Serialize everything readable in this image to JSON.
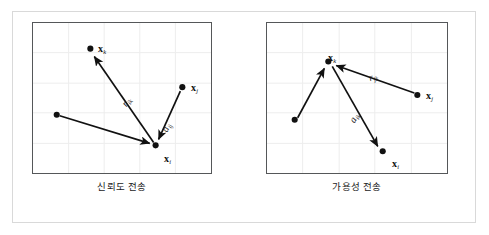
{
  "figure": {
    "type": "diagram",
    "background_color": "#ffffff",
    "frame_color": "#d9d9d9",
    "plot_border_color": "#555759",
    "grid_color": "#ececec",
    "ink_color": "#111111"
  },
  "panels": [
    {
      "id": "responsibility",
      "caption": "신뢰도 전송",
      "grid": {
        "columns": 4,
        "rows": 4,
        "visible": true
      },
      "nodes": [
        {
          "name": "node-xk",
          "label": "x",
          "sub": "k",
          "x": 58,
          "y": 26,
          "label_dx": 7,
          "label_dy": -12
        },
        {
          "name": "node-xj",
          "label": "x",
          "sub": "j",
          "x": 151,
          "y": 65,
          "label_dx": 7,
          "label_dy": -12
        },
        {
          "name": "node-xi",
          "label": "x",
          "sub": "i",
          "x": 124,
          "y": 124,
          "label_dx": 8,
          "label_dy": 2
        },
        {
          "name": "node-anon",
          "label": "",
          "sub": "",
          "x": 24,
          "y": 93,
          "label_dx": 0,
          "label_dy": 0
        }
      ],
      "arrows": [
        {
          "name": "arrow-xi-to-xk",
          "label": "r",
          "sub": "ik",
          "x1": 122,
          "y1": 121,
          "x2": 61,
          "y2": 32,
          "label_x": 97,
          "label_y": 74,
          "label_rot": -57
        },
        {
          "name": "arrow-xj-to-xi",
          "label": "a",
          "sub": "ij",
          "x1": 149,
          "y1": 69,
          "x2": 127,
          "y2": 120,
          "label_x": 140,
          "label_y": 100,
          "label_rot": -67
        },
        {
          "name": "arrow-anon-to-xi",
          "label": "",
          "sub": "",
          "x1": 27,
          "y1": 94,
          "x2": 120,
          "y2": 123,
          "label_x": 0,
          "label_y": 0,
          "label_rot": 0
        }
      ]
    },
    {
      "id": "availability",
      "caption": "가용성 전송",
      "grid": {
        "columns": 4,
        "rows": 4,
        "visible": true
      },
      "nodes": [
        {
          "name": "node-xk",
          "label": "x",
          "sub": "k",
          "x": 62,
          "y": 39,
          "label_dx": 4,
          "label_dy": -12
        },
        {
          "name": "node-xj",
          "label": "x",
          "sub": "j",
          "x": 152,
          "y": 73,
          "label_dx": 7,
          "label_dy": -10
        },
        {
          "name": "node-xi",
          "label": "x",
          "sub": "i",
          "x": 117,
          "y": 130,
          "label_dx": 8,
          "label_dy": 3
        },
        {
          "name": "node-anon",
          "label": "",
          "sub": "",
          "x": 28,
          "y": 98,
          "label_dx": 0,
          "label_dy": 0
        }
      ],
      "arrows": [
        {
          "name": "arrow-anon-to-xk",
          "label": "",
          "sub": "",
          "x1": 31,
          "y1": 96,
          "x2": 59,
          "y2": 44,
          "label_x": 0,
          "label_y": 0,
          "label_rot": 0
        },
        {
          "name": "arrow-xj-to-xk",
          "label": "r",
          "sub": "jk",
          "x1": 149,
          "y1": 71,
          "x2": 68,
          "y2": 42,
          "label_x": 105,
          "label_y": 50,
          "label_rot": -20
        },
        {
          "name": "arrow-xk-to-xi",
          "label": "a",
          "sub": "ik",
          "x1": 66,
          "y1": 44,
          "x2": 113,
          "y2": 127,
          "label_x": 93,
          "label_y": 91,
          "label_rot": -60
        }
      ]
    }
  ]
}
